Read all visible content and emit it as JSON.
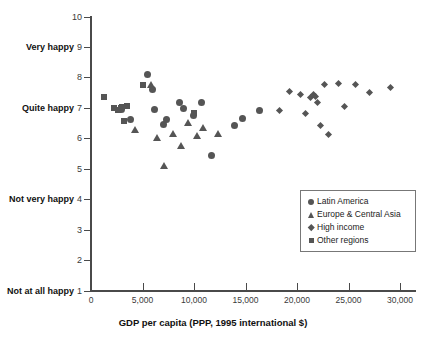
{
  "chart_data": {
    "type": "scatter",
    "title": "",
    "xlabel": "GDP per capita (PPP, 1995 international $)",
    "ylabel": "",
    "xlim": [
      0,
      31500
    ],
    "ylim": [
      1,
      10
    ],
    "grid": false,
    "legend_position": "inside-right-lower",
    "x_ticks": [
      0,
      5000,
      10000,
      15000,
      20000,
      25000,
      30000
    ],
    "x_tick_labels": [
      "0",
      "5,000",
      "10,000",
      "15,000",
      "20,000",
      "25,000",
      "30,000"
    ],
    "y_ticks": [
      1,
      2,
      3,
      4,
      5,
      6,
      7,
      8,
      9,
      10
    ],
    "y_tick_labels": [
      "1",
      "2",
      "3",
      "4",
      "5",
      "6",
      "7",
      "8",
      "9",
      "10"
    ],
    "y_category_labels": [
      {
        "value": 9,
        "label": "Very happy"
      },
      {
        "value": 7,
        "label": "Quite happy"
      },
      {
        "value": 4,
        "label": "Not very happy"
      },
      {
        "value": 1,
        "label": "Not at all happy"
      }
    ],
    "series": [
      {
        "name": "Latin America",
        "marker": "circle",
        "color": "#555555",
        "points": [
          [
            3000,
            6.95
          ],
          [
            3800,
            6.62
          ],
          [
            5450,
            8.12
          ],
          [
            5950,
            7.62
          ],
          [
            6200,
            6.95
          ],
          [
            7050,
            6.48
          ],
          [
            7350,
            6.62
          ],
          [
            8600,
            7.18
          ],
          [
            9000,
            7.0
          ],
          [
            9950,
            6.78
          ],
          [
            10700,
            7.18
          ],
          [
            11700,
            5.45
          ],
          [
            13900,
            6.45
          ],
          [
            14700,
            6.68
          ],
          [
            16400,
            6.92
          ]
        ]
      },
      {
        "name": "Europe & Central Asia",
        "marker": "triangle",
        "color": "#555555",
        "points": [
          [
            4300,
            6.32
          ],
          [
            5800,
            7.78
          ],
          [
            6400,
            6.05
          ],
          [
            7100,
            5.12
          ],
          [
            8000,
            6.18
          ],
          [
            8700,
            5.78
          ],
          [
            9400,
            6.52
          ],
          [
            10300,
            6.12
          ],
          [
            10900,
            6.38
          ],
          [
            12300,
            6.18
          ]
        ]
      },
      {
        "name": "High income",
        "marker": "diamond",
        "color": "#555555",
        "points": [
          [
            18300,
            6.92
          ],
          [
            19300,
            7.55
          ],
          [
            20300,
            7.45
          ],
          [
            20800,
            6.82
          ],
          [
            21300,
            7.35
          ],
          [
            21600,
            7.45
          ],
          [
            21800,
            7.38
          ],
          [
            22000,
            7.18
          ],
          [
            22300,
            6.45
          ],
          [
            22700,
            7.78
          ],
          [
            23100,
            6.15
          ],
          [
            24000,
            7.82
          ],
          [
            24600,
            7.05
          ],
          [
            25700,
            7.78
          ],
          [
            27000,
            7.52
          ],
          [
            29100,
            7.68
          ]
        ]
      },
      {
        "name": "Other regions",
        "marker": "square",
        "color": "#555555",
        "points": [
          [
            1250,
            7.38
          ],
          [
            2200,
            7.0
          ],
          [
            2650,
            6.95
          ],
          [
            2900,
            7.02
          ],
          [
            3050,
            7.05
          ],
          [
            3450,
            7.08
          ],
          [
            3200,
            6.58
          ],
          [
            5000,
            7.78
          ],
          [
            10000,
            6.85
          ]
        ]
      }
    ]
  },
  "legend": {
    "items": [
      {
        "label": "Latin America",
        "marker": "circle"
      },
      {
        "label": "Europe & Central Asia",
        "marker": "triangle"
      },
      {
        "label": "High income",
        "marker": "diamond"
      },
      {
        "label": "Other regions",
        "marker": "square"
      }
    ]
  },
  "colors": {
    "marker": "#555555",
    "axis": "#4a4a4a",
    "text": "#111111",
    "background": "#ffffff"
  }
}
